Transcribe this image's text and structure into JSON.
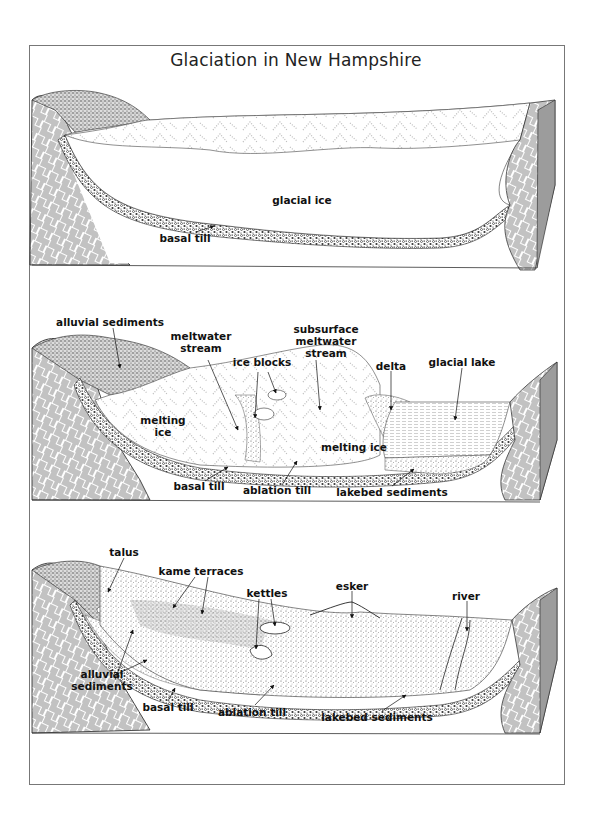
{
  "title": "Glaciation in New Hampshire",
  "panels": [
    {
      "id": "panel-1",
      "labels": {
        "glacial_ice": "glacial ice",
        "basal_till": "basal till"
      }
    },
    {
      "id": "panel-2",
      "labels": {
        "alluvial_sediments": "alluvial sediments",
        "meltwater_stream_1": "meltwater",
        "meltwater_stream_2": "stream",
        "ice_blocks": "ice blocks",
        "subsurface_1": "subsurface",
        "subsurface_2": "meltwater",
        "subsurface_3": "stream",
        "delta": "delta",
        "glacial_lake": "glacial lake",
        "melting_ice_left_1": "melting",
        "melting_ice_left_2": "ice",
        "melting_ice_right": "melting ice",
        "basal_till": "basal till",
        "ablation_till": "ablation till",
        "lakebed_sediments": "lakebed sediments"
      }
    },
    {
      "id": "panel-3",
      "labels": {
        "talus": "talus",
        "kame_terraces": "kame terraces",
        "kettles": "kettles",
        "esker": "esker",
        "river": "river",
        "alluvial_1": "alluvial",
        "alluvial_2": "sediments",
        "basal_till": "basal till",
        "ablation_till": "ablation till",
        "lakebed_sediments": "lakebed sediments"
      }
    }
  ],
  "colors": {
    "ink": "#111111",
    "frame": "#777777",
    "paper": "#ffffff"
  }
}
